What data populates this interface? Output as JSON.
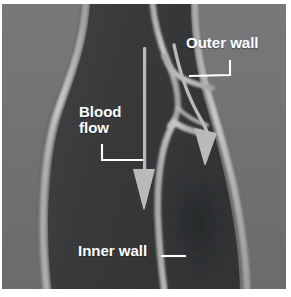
{
  "labels": {
    "outer_wall": "Outer wall",
    "blood_flow": "Blood\nflow",
    "inner_wall": "Inner wall"
  },
  "annotations": [
    {
      "name": "main-flow-arrow",
      "direction": "down",
      "meaning": "blood flow through main lumen"
    },
    {
      "name": "branch-flow-arrow",
      "direction": "down-right-curved",
      "meaning": "blood flow into side branch"
    }
  ],
  "colors": {
    "background_gray": "#6f7173",
    "vessel_wall_light": "#c3c5c2",
    "vessel_wall_mid": "#9a9c9a",
    "lumen_dark": "#3a3c3e",
    "lumen_shadow": "#2e3032",
    "arrow": "#b9bbb8",
    "label_text": "#ffffff",
    "leader_line": "#ffffff",
    "page_border": "#ffffff"
  }
}
